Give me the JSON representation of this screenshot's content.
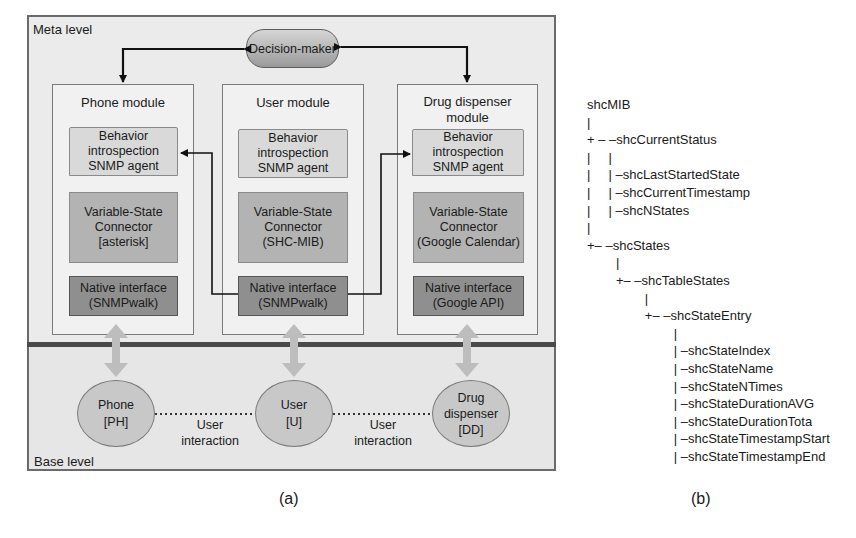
{
  "figure_a": {
    "caption": "(a)",
    "meta_level_label": "Meta level",
    "base_level_label": "Base level",
    "decision_maker": "Decision-maker",
    "modules": [
      {
        "title": [
          "Phone module"
        ],
        "agent": [
          "Behavior",
          "introspection",
          "SNMP agent"
        ],
        "connector": [
          "Variable-State",
          "Connector",
          "[asterisk]"
        ],
        "native": [
          "Native interface",
          "(SNMPwalk)"
        ]
      },
      {
        "title": [
          "User module"
        ],
        "agent": [
          "Behavior",
          "introspection",
          "SNMP agent"
        ],
        "connector": [
          "Variable-State",
          "Connector",
          "(SHC-MIB)"
        ],
        "native": [
          "Native interface",
          "(SNMPwalk)"
        ]
      },
      {
        "title": [
          "Drug dispenser",
          "module"
        ],
        "agent": [
          "Behavior",
          "introspection",
          "SNMP agent"
        ],
        "connector": [
          "Variable-State",
          "Connector",
          "(Google Calendar)"
        ],
        "native": [
          "Native interface",
          "(Google API)"
        ]
      }
    ],
    "base_nodes": [
      {
        "lines": [
          "Phone",
          "[PH]"
        ]
      },
      {
        "lines": [
          "User",
          "[U]"
        ]
      },
      {
        "lines": [
          "Drug",
          "dispenser",
          "[DD]"
        ]
      }
    ],
    "interactions": [
      {
        "lines": [
          "User",
          "interaction"
        ]
      },
      {
        "lines": [
          "User",
          "interaction"
        ]
      }
    ]
  },
  "figure_b": {
    "caption": "(b)",
    "tree_lines": [
      "shcMIB",
      "|",
      "+ – –shcCurrentStatus",
      "|     |",
      "|     | –shcLastStartedState",
      "|     | –shcCurrentTimestamp",
      "|     | –shcNStates",
      "|",
      "+– –shcStates",
      "        |",
      "        +– –shcTableStates",
      "                |",
      "                +– –shcStateEntry",
      "                        |",
      "                        | –shcStateIndex",
      "                        | –shcStateName",
      "                        | –shcStateNTimes",
      "                        | –shcStateDurationAVG",
      "                        | –shcStateDurationTota",
      "                        | –shcStateTimestampStart",
      "                        | –shcStateTimestampEnd"
    ]
  }
}
